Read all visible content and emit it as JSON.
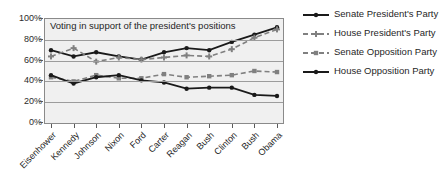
{
  "chart_data": {
    "type": "line",
    "title": "Voting in support of the president's positions",
    "xlabel": "",
    "ylabel": "",
    "ylim": [
      0,
      100
    ],
    "grid": true,
    "legend_position": "right",
    "categories": [
      "Eisenhower",
      "Kennedy",
      "Johnson",
      "Nixon",
      "Ford",
      "Carter",
      "Reagan",
      "Bush",
      "Clinton",
      "Bush",
      "Obama"
    ],
    "ytick_labels": [
      "0%",
      "20%",
      "40%",
      "60%",
      "80%",
      "100%"
    ],
    "ytick_values": [
      0,
      20,
      40,
      60,
      80,
      100
    ],
    "series": [
      {
        "name": "Senate President's Party",
        "style": "solid",
        "color": "#1a1a1a",
        "marker": "circle",
        "values": [
          70,
          64,
          68,
          64,
          61,
          68,
          72,
          70,
          78,
          85,
          92
        ]
      },
      {
        "name": "House President's Party",
        "style": "dashed",
        "color": "#808080",
        "marker": "plus",
        "values": [
          64,
          72,
          59,
          63,
          61,
          63,
          65,
          64,
          71,
          82,
          90
        ]
      },
      {
        "name": "Senate Opposition Party",
        "style": "dashed",
        "color": "#808080",
        "marker": "square",
        "values": [
          44,
          40,
          46,
          43,
          43,
          47,
          44,
          45,
          46,
          50,
          49
        ]
      },
      {
        "name": "House Opposition Party",
        "style": "solid",
        "color": "#1a1a1a",
        "marker": "circle",
        "values": [
          46,
          38,
          44,
          46,
          41,
          39,
          33,
          34,
          34,
          27,
          26
        ]
      }
    ]
  },
  "legend": {
    "entries": [
      {
        "label": "Senate President's Party"
      },
      {
        "label": "House President's Party"
      },
      {
        "label": "Senate Opposition Party"
      },
      {
        "label": "House Opposition Party"
      }
    ]
  }
}
